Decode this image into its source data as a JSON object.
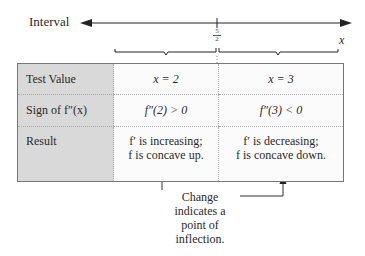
{
  "interval_axis": {
    "label": "Interval",
    "variable": "x",
    "split_point": {
      "numerator": "5",
      "denominator": "2"
    }
  },
  "table": {
    "rows": [
      {
        "label": "Test Value",
        "cells": [
          "x = 2",
          "x = 3"
        ]
      },
      {
        "label": "Sign of f″(x)",
        "cells": [
          "f″(2) > 0",
          "f″(3) < 0"
        ]
      },
      {
        "label": "Result",
        "cells": [
          {
            "line1": "f′ is increasing;",
            "line2": "f is concave up."
          },
          {
            "line1": "f′ is decreasing;",
            "line2": "f is concave down."
          }
        ]
      }
    ]
  },
  "callout": {
    "lines": [
      "Change",
      "indicates a",
      "point of",
      "inflection."
    ]
  },
  "colors": {
    "label_column_bg": "#d9d9d9",
    "cell_bg": "#fbfbfb",
    "border": "#777777",
    "text": "#2a2a2a"
  }
}
